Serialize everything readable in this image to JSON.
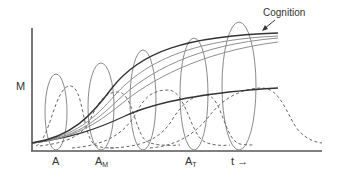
{
  "diagram": {
    "y_axis_label": "M",
    "x_axis_label": "t",
    "x_axis_arrow": "→",
    "annotation": {
      "label": "Cognition",
      "arrow": "pointer to top curve"
    },
    "markers": [
      {
        "base": "A",
        "sub": "",
        "x": 56
      },
      {
        "base": "A",
        "sub": "M",
        "x": 101
      },
      {
        "base": "A",
        "sub": "T",
        "x": 190
      }
    ],
    "colors": {
      "axis": "#555555",
      "ellipse": "#8a8a8a",
      "curve_dark": "#333333",
      "curve_gray": "#8f8f8f",
      "dashed": "#666666",
      "text": "#333333"
    },
    "ellipse_count": 5,
    "sigmoid_curve_count": 5,
    "dashed_pulse_count": 5
  }
}
